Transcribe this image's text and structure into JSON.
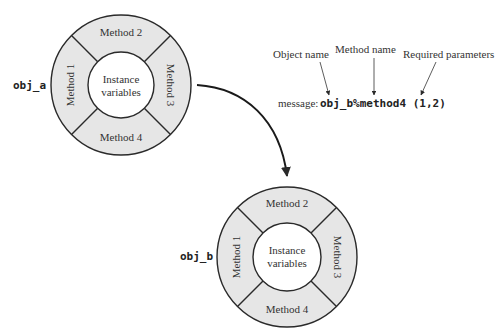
{
  "colors": {
    "ring_fill": "#e6e6e6",
    "inner_fill": "#ffffff",
    "stroke": "#2a2a2a",
    "text": "#333333"
  },
  "objects": [
    {
      "name": "obj_a",
      "methods": [
        "Method 1",
        "Method 2",
        "Method 3",
        "Method 4"
      ],
      "center_label_line1": "Instance",
      "center_label_line2": "variables"
    },
    {
      "name": "obj_b",
      "methods": [
        "Method 1",
        "Method 2",
        "Method 3",
        "Method 4"
      ],
      "center_label_line1": "Instance",
      "center_label_line2": "variables"
    }
  ],
  "message": {
    "prefix": "message:",
    "code": "obj_b%method4 (1,2)"
  },
  "annotations": {
    "object_name": "Object name",
    "method_name": "Method name",
    "required_parameters": "Required parameters"
  }
}
